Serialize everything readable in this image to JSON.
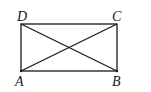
{
  "diagram": {
    "type": "rectangle-with-diagonals",
    "vertices": [
      {
        "label": "A",
        "x": 21,
        "y": 71
      },
      {
        "label": "B",
        "x": 117,
        "y": 71
      },
      {
        "label": "C",
        "x": 117,
        "y": 24
      },
      {
        "label": "D",
        "x": 21,
        "y": 24
      }
    ],
    "edges": [
      "AB",
      "BC",
      "CD",
      "DA"
    ],
    "diagonals": [
      "AC",
      "BD"
    ],
    "stroke_color": "#1a1a1a"
  },
  "labels": {
    "A": "A",
    "B": "B",
    "C": "C",
    "D": "D"
  }
}
